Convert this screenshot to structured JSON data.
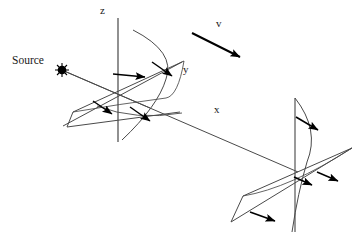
{
  "figure": {
    "type": "technical-line-diagram",
    "width": 354,
    "height": 238,
    "background_color": "#ffffff",
    "line_color": "#3a3a3a",
    "bold_line_color": "#000000",
    "text_color": "#1a1a1a"
  },
  "labels": {
    "source": "Source",
    "axis_z": "z",
    "axis_y": "y",
    "axis_x": "x",
    "velocity": "v"
  },
  "axes": {
    "z": {
      "label": "z",
      "label_x": 100,
      "label_y": 5,
      "orientation": "vertical"
    },
    "y": {
      "label": "y",
      "label_x": 183,
      "label_y": 65,
      "orientation": "diagonal-up-right"
    },
    "x": {
      "label": "x",
      "label_x": 214,
      "label_y": 104,
      "orientation": "diagonal-down-right"
    }
  },
  "source_point": {
    "label": "Source",
    "dot_x": 62,
    "dot_y": 70,
    "dot_radius": 4.2
  },
  "velocity_vector": {
    "label": "v",
    "from_x": 192,
    "from_y": 33,
    "to_x": 246,
    "to_y": 60
  },
  "elements": [
    {
      "name": "left-parabolic-reflector",
      "kind": "parabola",
      "opens": "left",
      "vertex_x": 166,
      "vertex_y": 79
    },
    {
      "name": "right-parabolic-reflector",
      "kind": "parabola",
      "opens": "right",
      "vertex_x": 307,
      "vertex_y": 160
    }
  ],
  "ray_arrows": [
    {
      "name": "ray-arrow-left-upper-inner",
      "from_x": 113,
      "from_y": 74,
      "to_x": 150,
      "to_y": 77
    },
    {
      "name": "ray-arrow-left-upper-outer",
      "from_x": 150,
      "from_y": 62,
      "to_x": 177,
      "to_y": 79
    },
    {
      "name": "ray-arrow-left-lower-inner",
      "from_x": 93,
      "from_y": 101,
      "to_x": 117,
      "to_y": 117
    },
    {
      "name": "ray-arrow-left-lower-outer",
      "from_x": 130,
      "from_y": 107,
      "to_x": 155,
      "to_y": 124
    },
    {
      "name": "ray-arrow-right-upper",
      "from_x": 296,
      "from_y": 117,
      "to_x": 323,
      "to_y": 133
    },
    {
      "name": "ray-arrow-right-middle",
      "from_x": 294,
      "from_y": 178,
      "to_x": 317,
      "to_y": 187
    },
    {
      "name": "ray-arrow-right-outer",
      "from_x": 317,
      "from_y": 172,
      "to_x": 343,
      "to_y": 182
    },
    {
      "name": "ray-arrow-right-lower",
      "from_x": 250,
      "from_y": 212,
      "to_x": 280,
      "to_y": 222
    }
  ]
}
